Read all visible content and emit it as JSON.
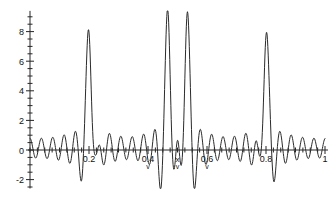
{
  "chart_data": {
    "type": "line",
    "title": "",
    "subtitle": "",
    "xlabel": "",
    "ylabel": "",
    "xlim": [
      0,
      1
    ],
    "ylim": [
      -2.6,
      9.4
    ],
    "grid": false,
    "legend": null,
    "x_ticks": [
      0.2,
      0.4,
      0.6,
      0.8,
      1
    ],
    "x_tick_labels": [
      "0.2",
      "0.4",
      "0.6",
      "0.8",
      "1"
    ],
    "x_minor_tick_step": 0.025,
    "y_ticks": [
      -2,
      0,
      2,
      4,
      6,
      8
    ],
    "y_tick_labels": [
      "-2",
      "0",
      "2",
      "4",
      "6",
      "8"
    ],
    "y_minor_tick_step": 0.5,
    "series": [
      {
        "name": "signal",
        "color": "#2b2b2b",
        "description": "oscillatory interference waveform with four tall narrow peaks",
        "peaks": [
          {
            "x": 0.2,
            "y": 8.3
          },
          {
            "x": 0.468,
            "y": 9.2
          },
          {
            "x": 0.532,
            "y": 9.2
          },
          {
            "x": 0.8,
            "y": 8.3
          }
        ],
        "troughs": [
          {
            "x": 0.175,
            "y": -1.7
          },
          {
            "x": 0.228,
            "y": -2.15
          },
          {
            "x": 0.443,
            "y": -2.3
          },
          {
            "x": 0.492,
            "y": -2.2
          },
          {
            "x": 0.508,
            "y": -2.2
          },
          {
            "x": 0.556,
            "y": -2.3
          },
          {
            "x": 0.775,
            "y": -2.0
          },
          {
            "x": 0.826,
            "y": -1.75
          }
        ],
        "baseline_ripple_amplitude": 1.2,
        "ripple_period": 0.0385,
        "samples_x_step": 0.00125
      }
    ],
    "annotations": [
      {
        "label": "0.4",
        "marker": "v",
        "x": 0.4,
        "kind": "x-tick-with-marker"
      },
      {
        "label": "x",
        "marker": "v",
        "x": 0.5,
        "kind": "center-marker"
      },
      {
        "label": "0.6",
        "marker": "v",
        "x": 0.6,
        "kind": "x-tick-with-marker"
      }
    ]
  },
  "axes": {
    "y_axis_name": "vertical-axis",
    "x_axis_name": "horizontal-axis"
  }
}
